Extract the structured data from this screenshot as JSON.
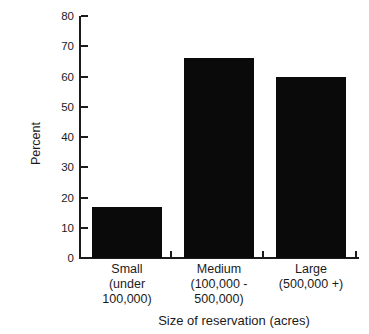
{
  "chart_data": {
    "type": "bar",
    "categories": [
      "Small (under 100,000)",
      "Medium (100,000 - 500,000)",
      "Large (500,000 +)"
    ],
    "category_lines": [
      [
        "Small",
        "(under",
        "100,000)"
      ],
      [
        "Medium",
        "(100,000 -",
        "500,000)"
      ],
      [
        "Large",
        "(500,000 +)"
      ]
    ],
    "values": [
      17,
      66,
      60
    ],
    "yticks": [
      0,
      10,
      20,
      30,
      40,
      50,
      60,
      70,
      80
    ],
    "ylim": [
      0,
      80
    ],
    "title": "",
    "xlabel": "Size of reservation (acres)",
    "ylabel": "Percent",
    "grid": false,
    "legend": false,
    "bar_color": "#0a0a0a",
    "axis_color": "#1b1b1b",
    "background_color": "#ffffff"
  }
}
